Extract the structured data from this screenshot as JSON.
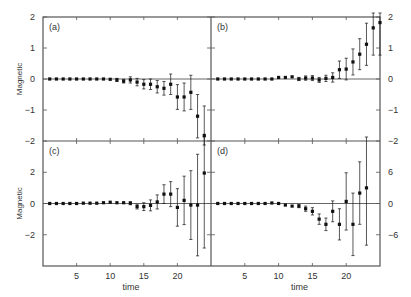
{
  "figure": {
    "layout": "2x2 panels sharing axes",
    "x_label": "time",
    "y_label": "Magnetic",
    "axis_color": "#555555",
    "point_color": "#111111"
  },
  "chart_data": [
    {
      "panel": "(a)",
      "type": "scatter",
      "error_bars": true,
      "xlabel": "",
      "ylabel": "Magnetic",
      "ylim": [
        -2,
        2
      ],
      "yticks": [
        -2,
        -1,
        0,
        1,
        2
      ],
      "xlim": [
        0,
        25
      ],
      "zero_line": true,
      "x": [
        1,
        2,
        3,
        4,
        5,
        6,
        7,
        8,
        9,
        10,
        11,
        12,
        13,
        14,
        15,
        16,
        17,
        18,
        19,
        20,
        21,
        22,
        23,
        24
      ],
      "y": [
        0,
        0,
        0,
        0,
        0,
        0,
        0,
        0,
        0,
        -0.01,
        -0.03,
        -0.07,
        -0.03,
        -0.1,
        -0.17,
        -0.17,
        -0.25,
        -0.3,
        -0.17,
        -0.58,
        -0.58,
        -0.43,
        -1.2,
        -1.82
      ],
      "err": [
        0.01,
        0.01,
        0.01,
        0.01,
        0.01,
        0.01,
        0.01,
        0.02,
        0.02,
        0.03,
        0.05,
        0.06,
        0.1,
        0.12,
        0.15,
        0.17,
        0.2,
        0.22,
        0.33,
        0.4,
        0.45,
        0.55,
        0.7,
        0.95
      ]
    },
    {
      "panel": "(b)",
      "type": "scatter",
      "error_bars": true,
      "xlabel": "",
      "ylabel": "",
      "ylim": [
        -2,
        2
      ],
      "yticks": [
        -2,
        -1,
        0,
        1,
        2
      ],
      "ytick_side": "right",
      "xlim": [
        0,
        25
      ],
      "zero_line": true,
      "x": [
        1,
        2,
        3,
        4,
        5,
        6,
        7,
        8,
        9,
        10,
        11,
        12,
        13,
        14,
        15,
        16,
        17,
        18,
        19,
        20,
        21,
        22,
        23,
        24,
        25
      ],
      "y": [
        0,
        0,
        0,
        0,
        0,
        0,
        0,
        0,
        0,
        0.05,
        0.05,
        0.07,
        0,
        0.03,
        0.03,
        -0.03,
        0.02,
        0.05,
        0.3,
        0.32,
        0.55,
        0.8,
        1.12,
        1.65,
        1.82
      ],
      "err": [
        0.01,
        0.01,
        0.01,
        0.01,
        0.01,
        0.01,
        0.01,
        0.01,
        0.01,
        0.02,
        0.02,
        0.03,
        0.05,
        0.07,
        0.08,
        0.08,
        0.1,
        0.15,
        0.28,
        0.35,
        0.42,
        0.5,
        0.68,
        0.88,
        1.05
      ]
    },
    {
      "panel": "(c)",
      "type": "scatter",
      "error_bars": true,
      "xlabel": "time",
      "ylabel": "Magnetic",
      "ylim": [
        -4,
        4
      ],
      "yticks": [
        -2,
        0,
        2
      ],
      "xlim": [
        0,
        25
      ],
      "xticks": [
        5,
        10,
        15,
        20
      ],
      "zero_line": true,
      "x": [
        1,
        2,
        3,
        4,
        5,
        6,
        7,
        8,
        9,
        10,
        11,
        12,
        13,
        14,
        15,
        16,
        17,
        18,
        19,
        20,
        21,
        22,
        23,
        24
      ],
      "y": [
        0,
        0,
        0,
        0,
        0,
        0.02,
        0.02,
        0.02,
        0.05,
        0.08,
        0.05,
        0.05,
        0.02,
        -0.2,
        -0.2,
        -0.12,
        0.1,
        0.6,
        0.6,
        -0.25,
        0.2,
        -0.1,
        -0.1,
        1.95
      ],
      "err": [
        0.02,
        0.02,
        0.02,
        0.02,
        0.02,
        0.03,
        0.03,
        0.03,
        0.04,
        0.05,
        0.06,
        0.08,
        0.1,
        0.15,
        0.25,
        0.35,
        0.45,
        0.6,
        0.8,
        1.2,
        1.55,
        2.2,
        3.25,
        4.8
      ]
    },
    {
      "panel": "(d)",
      "type": "scatter",
      "error_bars": true,
      "xlabel": "time",
      "ylabel": "",
      "ylim": [
        -12,
        12
      ],
      "yticks": [
        -6,
        0,
        6
      ],
      "ytick_side": "right",
      "xlim": [
        0,
        25
      ],
      "xticks": [
        5,
        10,
        15,
        20
      ],
      "zero_line": true,
      "x": [
        1,
        2,
        3,
        4,
        5,
        6,
        7,
        8,
        9,
        10,
        11,
        12,
        13,
        14,
        15,
        16,
        17,
        18,
        19,
        20,
        21,
        22,
        23
      ],
      "y": [
        0,
        0,
        0,
        0,
        0,
        0,
        0,
        0,
        0.1,
        0,
        -0.3,
        -0.5,
        -0.5,
        -1,
        -1.5,
        -3,
        -4,
        -1.5,
        -4,
        0.4,
        -4,
        2,
        3
      ],
      "err": [
        0.05,
        0.05,
        0.05,
        0.05,
        0.05,
        0.05,
        0.05,
        0.05,
        0.1,
        0.1,
        0.15,
        0.2,
        0.3,
        0.5,
        0.7,
        1,
        1.2,
        2,
        3,
        5.5,
        6,
        6,
        11
      ]
    }
  ]
}
